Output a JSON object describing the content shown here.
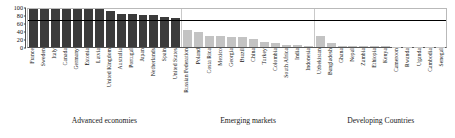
{
  "chart_data": {
    "type": "bar",
    "title": "",
    "subtitle": "",
    "xlabel": "",
    "ylabel": "",
    "ylim": [
      0,
      100
    ],
    "yticks": [
      0,
      20,
      40,
      60,
      80,
      100
    ],
    "grid": false,
    "legend": "none",
    "reference_line": {
      "value": 70,
      "color": "#000000",
      "label": ""
    },
    "groups": [
      {
        "name": "Advanced economies",
        "bar_color": "#3b3b3b",
        "categories": [
          "France",
          "Sweden",
          "Italy",
          "Canada",
          "Germany",
          "Estonia",
          "Latvia",
          "United Kingdom",
          "Australia",
          "Portugal",
          "Japan",
          "Netherlands",
          "Spain",
          "United States"
        ],
        "values": [
          100,
          100,
          100,
          100,
          100,
          100,
          100,
          95,
          88,
          88,
          85,
          83,
          79,
          76
        ]
      },
      {
        "name": "Emerging markets",
        "bar_color": "#c3c3c3",
        "categories": [
          "Russian Federation",
          "Poland",
          "Costa Rica",
          "Mexico",
          "Georgia",
          "Brazil",
          "China",
          "Turkey",
          "Colombia",
          "South Africa",
          "India",
          "Indonesia"
        ],
        "values": [
          45,
          40,
          30,
          28,
          27,
          27,
          20,
          12,
          10,
          6,
          4,
          2
        ]
      },
      {
        "name": "Developing Countries",
        "bar_color": "#c3c3c3",
        "categories": [
          "Uzbekistan",
          "Bangladesh",
          "Ghana",
          "Nepal",
          "Zambia",
          "Ethiopia",
          "Kenya",
          "Cameroon",
          "Rwanda",
          "Uganda",
          "Cambodia",
          "Senegal"
        ],
        "values": [
          30,
          10,
          3,
          2,
          2,
          1.5,
          1.5,
          1,
          1,
          1,
          0.8,
          0.5
        ]
      }
    ]
  },
  "axis": {
    "y_tick_labels": [
      "100",
      "80",
      "60",
      "40",
      "20",
      "0"
    ]
  }
}
